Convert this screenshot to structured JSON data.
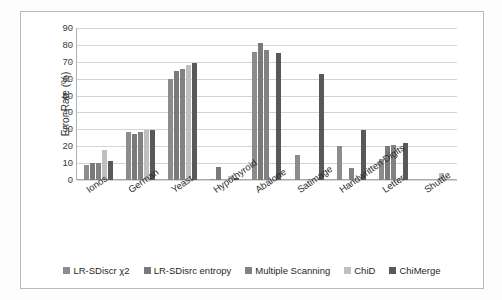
{
  "chart_data": {
    "type": "bar",
    "title": "",
    "xlabel": "",
    "ylabel": "Error Rate (%)",
    "ylim": [
      0,
      90
    ],
    "yticks": [
      90,
      80,
      70,
      60,
      50,
      40,
      30,
      20,
      10,
      0
    ],
    "grid": true,
    "legend_position": "bottom",
    "categories": [
      "Ionos",
      "German",
      "Yeast",
      "Hypothyroid",
      "Abalone",
      "Satimage",
      "Handwritten Digits",
      "Letter",
      "Shuttle"
    ],
    "series": [
      {
        "name": "LR-SDiscr χ2",
        "color": "#8c8c8c",
        "values": [
          9,
          28.5,
          60,
          0.5,
          76,
          15,
          20,
          12.5,
          null
        ]
      },
      {
        "name": "LR-SDisrc  entropy",
        "color": "#7a7a7a",
        "values": [
          10,
          27.5,
          64.5,
          8,
          81,
          null,
          null,
          20,
          null
        ]
      },
      {
        "name": "Multiple Scanning",
        "color": "#828282",
        "values": [
          10,
          28.5,
          66,
          null,
          77,
          null,
          7,
          21,
          null
        ]
      },
      {
        "name": "ChiD",
        "color": "#bfbfbf",
        "values": [
          17.5,
          29.5,
          68,
          2.5,
          null,
          null,
          null,
          null,
          4
        ]
      },
      {
        "name": "ChiMerge",
        "color": "#595959",
        "values": [
          11.5,
          29.5,
          69,
          1,
          75,
          63,
          29.5,
          22,
          null
        ]
      }
    ]
  },
  "legend": {
    "items": [
      {
        "label": "LR-SDiscr χ2",
        "color": "#8c8c8c"
      },
      {
        "label": "LR-SDisrc  entropy",
        "color": "#7a7a7a"
      },
      {
        "label": "Multiple Scanning",
        "color": "#828282"
      },
      {
        "label": "ChiD",
        "color": "#bfbfbf"
      },
      {
        "label": "ChiMerge",
        "color": "#595959"
      }
    ]
  }
}
